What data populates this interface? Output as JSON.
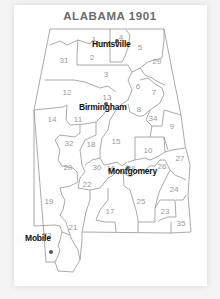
{
  "map": {
    "title": "ALABAMA 1901",
    "colors": {
      "background": "#f4f4f4",
      "card": "#ffffff",
      "border": "#9a9a9a",
      "district_label": "#9a9a9a",
      "city_label": "#111111",
      "title": "#6b6b6b"
    },
    "districts": [
      {
        "id": "1",
        "x": 94,
        "y": 39
      },
      {
        "id": "2",
        "x": 92,
        "y": 57
      },
      {
        "id": "3",
        "x": 106,
        "y": 74
      },
      {
        "id": "4",
        "x": 121,
        "y": 37
      },
      {
        "id": "5",
        "x": 140,
        "y": 47
      },
      {
        "id": "6",
        "x": 138,
        "y": 86
      },
      {
        "id": "7",
        "x": 154,
        "y": 92
      },
      {
        "id": "8",
        "x": 139,
        "y": 109
      },
      {
        "id": "9",
        "x": 172,
        "y": 126
      },
      {
        "id": "10",
        "x": 148,
        "y": 150
      },
      {
        "id": "11",
        "x": 78,
        "y": 119
      },
      {
        "id": "12",
        "x": 67,
        "y": 92
      },
      {
        "id": "13",
        "x": 107,
        "y": 97
      },
      {
        "id": "14",
        "x": 52,
        "y": 119
      },
      {
        "id": "15",
        "x": 116,
        "y": 141
      },
      {
        "id": "16",
        "x": 111,
        "y": 168
      },
      {
        "id": "17",
        "x": 110,
        "y": 211
      },
      {
        "id": "18",
        "x": 91,
        "y": 144
      },
      {
        "id": "19",
        "x": 49,
        "y": 201
      },
      {
        "id": "20",
        "x": 68,
        "y": 167
      },
      {
        "id": "21",
        "x": 73,
        "y": 227
      },
      {
        "id": "22",
        "x": 87,
        "y": 184
      },
      {
        "id": "23",
        "x": 165,
        "y": 211
      },
      {
        "id": "24",
        "x": 174,
        "y": 189
      },
      {
        "id": "25",
        "x": 141,
        "y": 201
      },
      {
        "id": "26",
        "x": 162,
        "y": 166
      },
      {
        "id": "27",
        "x": 180,
        "y": 158
      },
      {
        "id": "28",
        "x": 131,
        "y": 168
      },
      {
        "id": "29",
        "x": 157,
        "y": 61
      },
      {
        "id": "30",
        "x": 97,
        "y": 167
      },
      {
        "id": "31",
        "x": 64,
        "y": 60
      },
      {
        "id": "32",
        "x": 69,
        "y": 143
      },
      {
        "id": "33",
        "x": 47,
        "y": 235
      },
      {
        "id": "34",
        "x": 153,
        "y": 118
      },
      {
        "id": "35",
        "x": 181,
        "y": 223
      }
    ],
    "cities": [
      {
        "name": "Huntsville",
        "marker": "dot",
        "mx": 117,
        "my": 41,
        "lx": 92,
        "ly": 45
      },
      {
        "name": "Birmingham",
        "marker": "dot",
        "mx": 106,
        "my": 104,
        "lx": 79,
        "ly": 108
      },
      {
        "name": "Montgomery",
        "marker": "star",
        "mx": 128,
        "my": 168,
        "lx": 108,
        "ly": 172
      },
      {
        "name": "Mobile",
        "marker": "dot",
        "mx": 51,
        "my": 252,
        "lx": 25,
        "ly": 239
      }
    ]
  }
}
